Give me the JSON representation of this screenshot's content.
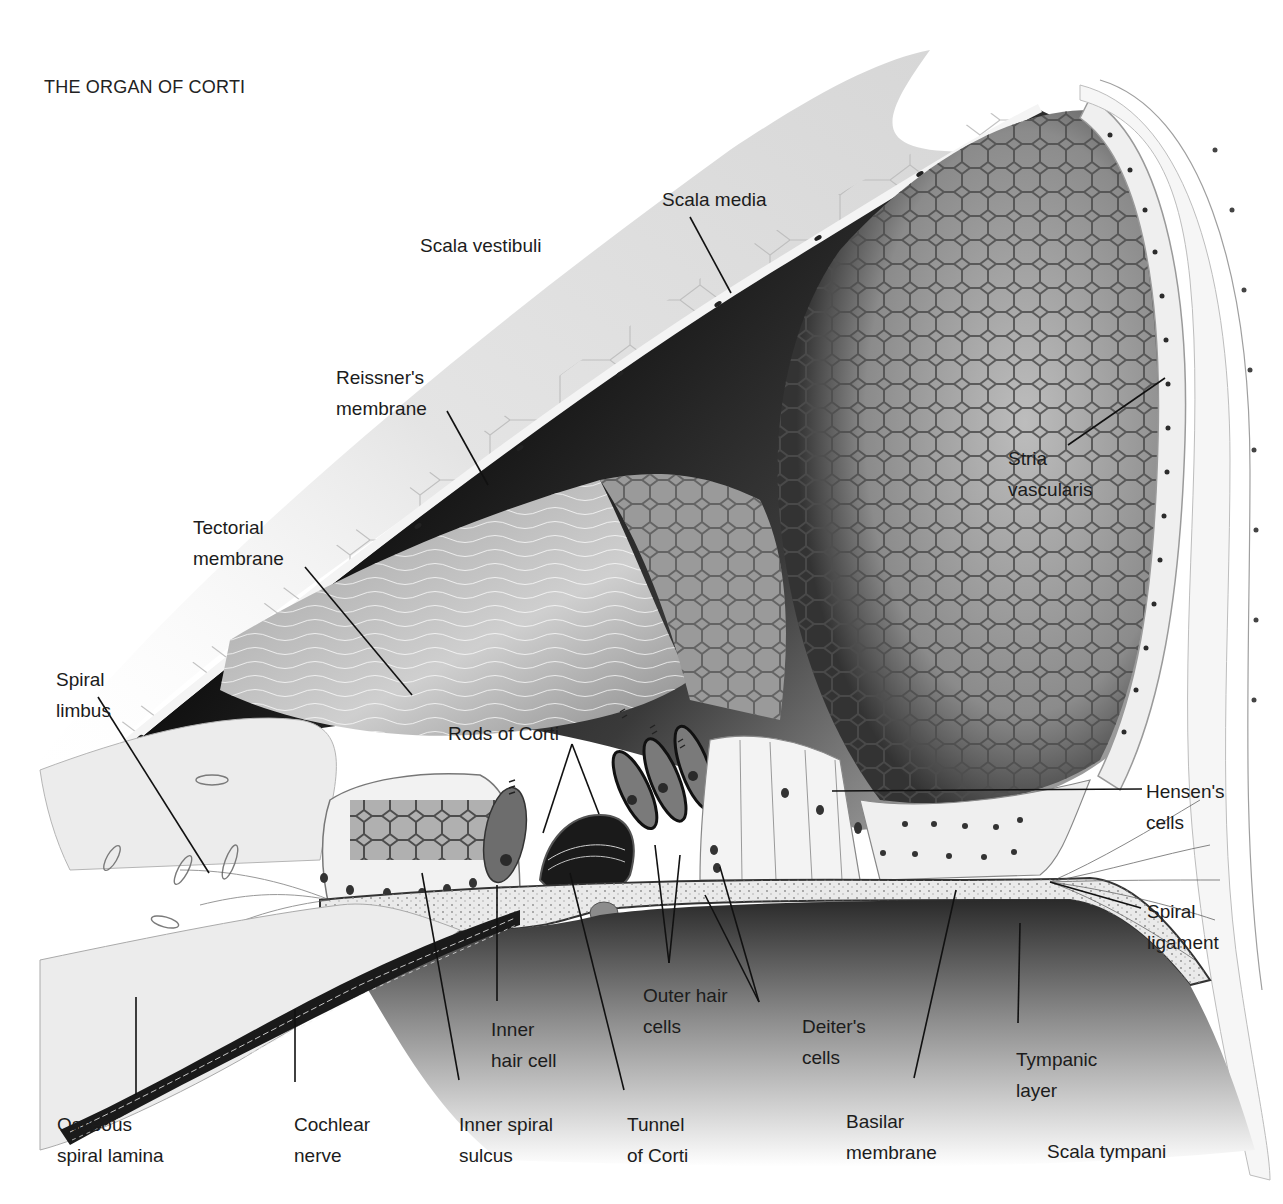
{
  "figure": {
    "title": "THE ORGAN OF CORTI",
    "colors": {
      "background": "#ffffff",
      "scala_media_dark": "#0d0d0d",
      "membrane_light": "#e9e9e9",
      "cell_fill": "#f2f2f2",
      "cell_outline": "#8a8a8a",
      "nucleus": "#3a3a3a",
      "leader_line": "#111111",
      "text": "#1c1c1c"
    }
  },
  "labels": {
    "scala_vestibuli": {
      "line1": "Scala vestibuli"
    },
    "scala_media": {
      "line1": "Scala media"
    },
    "reissners": {
      "line1": "Reissner's",
      "line2": "membrane"
    },
    "tectorial": {
      "line1": "Tectorial",
      "line2": "membrane"
    },
    "stria": {
      "line1": "Stria",
      "line2": "vascularis"
    },
    "spiral_limbus": {
      "line1": "Spiral",
      "line2": "limbus"
    },
    "rods_of_corti": {
      "line1": "Rods of Corti"
    },
    "hensens": {
      "line1": "Hensen's",
      "line2": "cells"
    },
    "spiral_ligament": {
      "line1": "Spiral",
      "line2": "ligament"
    },
    "outer_hair_cells": {
      "line1": "Outer hair",
      "line2": "cells"
    },
    "inner_hair_cell": {
      "line1": "Inner",
      "line2": "hair cell"
    },
    "deiters": {
      "line1": "Deiter's",
      "line2": "cells"
    },
    "tympanic_layer": {
      "line1": "Tympanic",
      "line2": "layer"
    },
    "osseous": {
      "line1": "Osseous",
      "line2": "spiral lamina"
    },
    "cochlear_nerve": {
      "line1": "Cochlear",
      "line2": "nerve"
    },
    "inner_spiral_sulcus": {
      "line1": "Inner spiral",
      "line2": "sulcus"
    },
    "tunnel_of_corti": {
      "line1": "Tunnel",
      "line2": "of Corti"
    },
    "basilar_membrane": {
      "line1": "Basilar",
      "line2": "membrane"
    },
    "scala_tympani": {
      "line1": "Scala tympani"
    }
  }
}
